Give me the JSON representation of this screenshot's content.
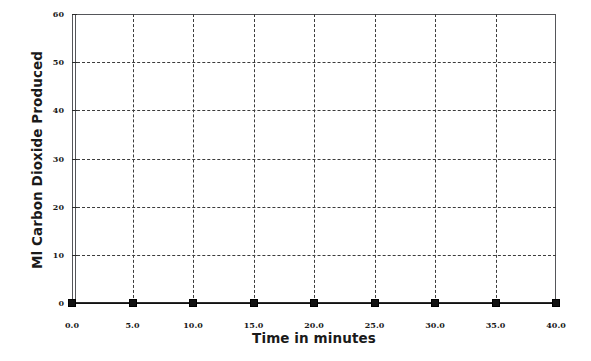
{
  "chart_data": {
    "type": "line",
    "title": "",
    "xlabel": "Time in minutes",
    "ylabel": "Ml Carbon Dioxide Produced",
    "xlim": [
      0,
      40
    ],
    "ylim": [
      0,
      60
    ],
    "xticks": [
      0,
      5,
      10,
      15,
      20,
      25,
      30,
      35,
      40
    ],
    "xtick_labels": [
      "0.0",
      "5.0",
      "10.0",
      "15.0",
      "20.0",
      "25.0",
      "30.0",
      "35.0",
      "40.0"
    ],
    "yticks": [
      0,
      10,
      20,
      30,
      40,
      50,
      60
    ],
    "ytick_labels": [
      "0",
      "10",
      "20",
      "30",
      "40",
      "50",
      "60"
    ],
    "grid": "both-dashed",
    "legend": "none",
    "marker": "filled-square",
    "series": [
      {
        "name": "Carbon Dioxide Produced",
        "x": [
          0,
          5,
          10,
          15,
          20,
          25,
          30,
          35,
          40
        ],
        "values": [
          0,
          0,
          0,
          0,
          0,
          0,
          0,
          0,
          0
        ],
        "color": "#111111"
      }
    ]
  },
  "colors": {
    "background": "#ffffff",
    "axis": "#2b2b2b",
    "frame": "#55565a",
    "grid": "#3c3c3c",
    "marker": "#111111",
    "text": "#1a1a1a"
  }
}
